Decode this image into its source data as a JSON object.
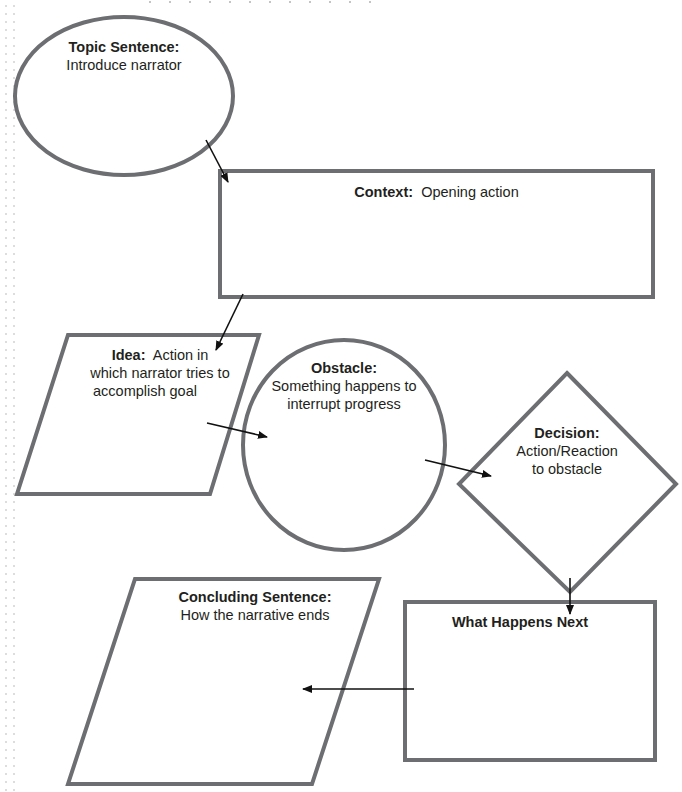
{
  "diagram": {
    "type": "narrative paragraph flowchart",
    "colors": {
      "shape_stroke": "#6d6e71",
      "arrow": "#111111",
      "text": "#231f20",
      "background": "#ffffff"
    },
    "nodes": [
      {
        "id": "topic_sentence",
        "shape": "ellipse",
        "title": "Topic Sentence:",
        "body": "Introduce narrator"
      },
      {
        "id": "context",
        "shape": "rectangle",
        "title": "Context:",
        "body": "Opening action"
      },
      {
        "id": "idea",
        "shape": "parallelogram",
        "title": "Idea:",
        "body_line1": "Action in",
        "body_line2": "which narrator tries to",
        "body_line3": "accomplish goal"
      },
      {
        "id": "obstacle",
        "shape": "circle",
        "title": "Obstacle:",
        "body_line1": "Something happens to",
        "body_line2": "interrupt progress"
      },
      {
        "id": "decision",
        "shape": "diamond",
        "title": "Decision:",
        "body_line1": "Action/Reaction",
        "body_line2": "to obstacle"
      },
      {
        "id": "what_happens_next",
        "shape": "rectangle",
        "title": "What Happens Next"
      },
      {
        "id": "concluding_sentence",
        "shape": "parallelogram",
        "title": "Concluding Sentence:",
        "body": "How the narrative ends"
      }
    ],
    "edges": [
      {
        "from": "topic_sentence",
        "to": "context"
      },
      {
        "from": "context",
        "to": "idea"
      },
      {
        "from": "idea",
        "to": "obstacle"
      },
      {
        "from": "obstacle",
        "to": "decision"
      },
      {
        "from": "decision",
        "to": "what_happens_next"
      },
      {
        "from": "what_happens_next",
        "to": "concluding_sentence"
      }
    ]
  }
}
